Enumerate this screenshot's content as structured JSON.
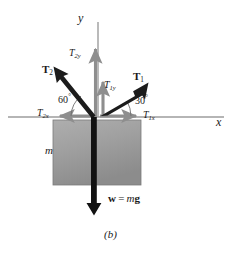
{
  "figure": {
    "caption": "(b)"
  },
  "axes": {
    "x_label": "x",
    "y_label": "y",
    "origin": {
      "x": 98,
      "y": 117
    },
    "x_axis_left_end": 8,
    "x_axis_right_end": 224,
    "y_axis_top_end": 22,
    "color": "#9d9d9d"
  },
  "block": {
    "mass_label": "m",
    "left": 53,
    "top": 120,
    "width": 88,
    "height": 65,
    "fill_start": "#a6a6a6",
    "fill_end": "#8f8f8f",
    "border": "#7c7c7c"
  },
  "vectors": [
    {
      "name": "T2",
      "label": "T",
      "subscript": "2",
      "style": "bold-black",
      "color": "#1a1a1a",
      "angle_deg": 120,
      "direction": "up-left",
      "tip": {
        "x": 54,
        "y": 69
      }
    },
    {
      "name": "T1",
      "label": "T",
      "subscript": "1",
      "style": "bold-black",
      "color": "#1a1a1a",
      "angle_deg": 30,
      "direction": "up-right",
      "tip": {
        "x": 147,
        "y": 83
      }
    },
    {
      "name": "T2y",
      "label": "T",
      "subscript": "2y",
      "style": "gray-component",
      "color": "#8e8e8e",
      "direction": "up",
      "tip": {
        "x": 96,
        "y": 45
      }
    },
    {
      "name": "T1y",
      "label": "T",
      "subscript": "1y",
      "style": "gray-component",
      "color": "#8e8e8e",
      "direction": "up",
      "tip": {
        "x": 103,
        "y": 78
      }
    },
    {
      "name": "T2x",
      "label": "T",
      "subscript": "2x",
      "style": "gray-component",
      "color": "#8e8e8e",
      "direction": "left",
      "tip": {
        "x": 55,
        "y": 117
      }
    },
    {
      "name": "T1x",
      "label": "T",
      "subscript": "1x",
      "style": "gray-component",
      "color": "#8e8e8e",
      "direction": "right",
      "tip": {
        "x": 140,
        "y": 117
      }
    },
    {
      "name": "weight",
      "label": "w",
      "style": "bold-black",
      "color": "#111111",
      "direction": "down",
      "tip": {
        "x": 94,
        "y": 214
      }
    }
  ],
  "angles": {
    "left": {
      "value": "60",
      "unit": "°",
      "between": "T2 and negative x-axis"
    },
    "right": {
      "value": "30",
      "unit": "°",
      "between": "T1 and positive x-axis"
    }
  },
  "weight_equation": {
    "symbol": "w",
    "equals": "=",
    "mass": "m",
    "gravity": "g"
  },
  "colors": {
    "background": "#ffffff",
    "axis_gray": "#9d9d9d",
    "component_gray": "#8e8e8e",
    "vector_black": "#1a1a1a",
    "text": "#1a1a1a"
  }
}
